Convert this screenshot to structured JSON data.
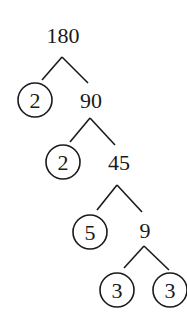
{
  "diagram": {
    "type": "factor-tree",
    "root": "180",
    "nodes": [
      {
        "id": "n180",
        "label": "180",
        "prime": false,
        "x": 63,
        "y": 43
      },
      {
        "id": "p2a",
        "label": "2",
        "prime": true,
        "x": 35,
        "y": 100
      },
      {
        "id": "n90",
        "label": "90",
        "prime": false,
        "x": 91,
        "y": 108
      },
      {
        "id": "p2b",
        "label": "2",
        "prime": true,
        "x": 63,
        "y": 162
      },
      {
        "id": "n45",
        "label": "45",
        "prime": false,
        "x": 119,
        "y": 170
      },
      {
        "id": "p5",
        "label": "5",
        "prime": true,
        "x": 90,
        "y": 232
      },
      {
        "id": "n9",
        "label": "9",
        "prime": false,
        "x": 145,
        "y": 238
      },
      {
        "id": "p3a",
        "label": "3",
        "prime": true,
        "x": 117,
        "y": 290
      },
      {
        "id": "p3b",
        "label": "3",
        "prime": true,
        "x": 170,
        "y": 290
      }
    ],
    "edges": [
      {
        "from": "n180",
        "to": "p2a",
        "x1": 62,
        "y1": 57,
        "x2": 42,
        "y2": 80
      },
      {
        "from": "n180",
        "to": "n90",
        "x1": 62,
        "y1": 57,
        "x2": 88,
        "y2": 83
      },
      {
        "from": "n90",
        "to": "p2b",
        "x1": 90,
        "y1": 118,
        "x2": 70,
        "y2": 142
      },
      {
        "from": "n90",
        "to": "n45",
        "x1": 90,
        "y1": 118,
        "x2": 115,
        "y2": 145
      },
      {
        "from": "n45",
        "to": "p5",
        "x1": 117,
        "y1": 185,
        "x2": 97,
        "y2": 210
      },
      {
        "from": "n45",
        "to": "n9",
        "x1": 117,
        "y1": 185,
        "x2": 142,
        "y2": 212
      },
      {
        "from": "n9",
        "to": "p3a",
        "x1": 144,
        "y1": 246,
        "x2": 124,
        "y2": 268
      },
      {
        "from": "n9",
        "to": "p3b",
        "x1": 144,
        "y1": 246,
        "x2": 169,
        "y2": 270
      }
    ],
    "prime_factorization": [
      "2",
      "2",
      "5",
      "3",
      "3"
    ]
  }
}
